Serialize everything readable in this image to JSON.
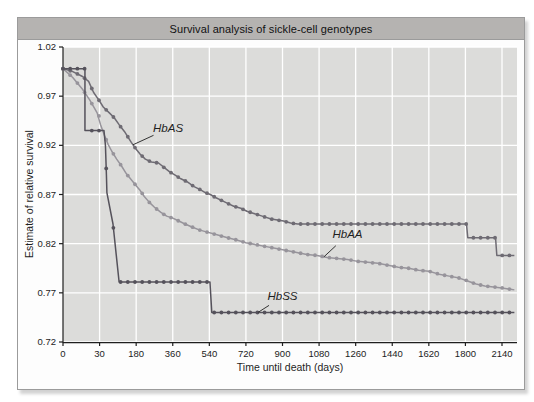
{
  "chart_data": {
    "type": "line",
    "title": "Survival analysis of sickle-cell genotypes",
    "xlabel": "Time until death (days)",
    "ylabel": "Estimate of relative survival",
    "x_ticks": [
      0,
      30,
      180,
      360,
      540,
      720,
      900,
      1080,
      1260,
      1440,
      1620,
      1800,
      2140
    ],
    "x_scale_note": "ticks are evenly spaced on screen although day values are non-linear",
    "y_ticks": [
      1.02,
      0.97,
      0.92,
      0.87,
      0.82,
      0.77,
      0.72
    ],
    "ylim": [
      0.72,
      1.02
    ],
    "grid": "white gridlines on light-gray plot background",
    "legend_position": "inline italic labels with pointer lines",
    "marker": "small filled circles along each step curve",
    "series": [
      {
        "name": "HbAA",
        "color": "#97949b",
        "points": [
          [
            0,
            0.998
          ],
          [
            8,
            0.989
          ],
          [
            16,
            0.977
          ],
          [
            22,
            0.966
          ],
          [
            28,
            0.953
          ],
          [
            34,
            0.941
          ],
          [
            50,
            0.93
          ],
          [
            65,
            0.921
          ],
          [
            80,
            0.914
          ],
          [
            100,
            0.906
          ],
          [
            120,
            0.899
          ],
          [
            140,
            0.891
          ],
          [
            160,
            0.885
          ],
          [
            180,
            0.879
          ],
          [
            200,
            0.874
          ],
          [
            220,
            0.868
          ],
          [
            245,
            0.862
          ],
          [
            270,
            0.857
          ],
          [
            300,
            0.852
          ],
          [
            330,
            0.848
          ],
          [
            360,
            0.846
          ],
          [
            390,
            0.843
          ],
          [
            420,
            0.84
          ],
          [
            455,
            0.837
          ],
          [
            490,
            0.834
          ],
          [
            525,
            0.832
          ],
          [
            560,
            0.83
          ],
          [
            595,
            0.828
          ],
          [
            630,
            0.826
          ],
          [
            670,
            0.824
          ],
          [
            720,
            0.821
          ],
          [
            770,
            0.819
          ],
          [
            820,
            0.817
          ],
          [
            870,
            0.815
          ],
          [
            920,
            0.813
          ],
          [
            970,
            0.811
          ],
          [
            1020,
            0.809
          ],
          [
            1070,
            0.808
          ],
          [
            1120,
            0.806
          ],
          [
            1170,
            0.805
          ],
          [
            1220,
            0.804
          ],
          [
            1270,
            0.802
          ],
          [
            1320,
            0.801
          ],
          [
            1370,
            0.8
          ],
          [
            1420,
            0.798
          ],
          [
            1470,
            0.796
          ],
          [
            1520,
            0.795
          ],
          [
            1570,
            0.793
          ],
          [
            1620,
            0.792
          ],
          [
            1670,
            0.789
          ],
          [
            1720,
            0.787
          ],
          [
            1770,
            0.785
          ],
          [
            1820,
            0.782
          ],
          [
            1900,
            0.779
          ],
          [
            1980,
            0.777
          ],
          [
            2060,
            0.776
          ],
          [
            2140,
            0.775
          ],
          [
            2255,
            0.773
          ]
        ]
      },
      {
        "name": "HbAS",
        "color": "#6e6b73",
        "points": [
          [
            0,
            0.998
          ],
          [
            8,
            0.995
          ],
          [
            16,
            0.99
          ],
          [
            21,
            0.985
          ],
          [
            25,
            0.974
          ],
          [
            30,
            0.965
          ],
          [
            45,
            0.959
          ],
          [
            70,
            0.953
          ],
          [
            90,
            0.948
          ],
          [
            110,
            0.941
          ],
          [
            135,
            0.933
          ],
          [
            160,
            0.923
          ],
          [
            180,
            0.916
          ],
          [
            200,
            0.911
          ],
          [
            225,
            0.906
          ],
          [
            255,
            0.903
          ],
          [
            290,
            0.902
          ],
          [
            320,
            0.897
          ],
          [
            345,
            0.893
          ],
          [
            370,
            0.89
          ],
          [
            400,
            0.886
          ],
          [
            430,
            0.883
          ],
          [
            465,
            0.878
          ],
          [
            495,
            0.875
          ],
          [
            520,
            0.872
          ],
          [
            545,
            0.87
          ],
          [
            570,
            0.867
          ],
          [
            600,
            0.864
          ],
          [
            630,
            0.861
          ],
          [
            660,
            0.858
          ],
          [
            695,
            0.856
          ],
          [
            725,
            0.853
          ],
          [
            755,
            0.851
          ],
          [
            785,
            0.849
          ],
          [
            815,
            0.847
          ],
          [
            845,
            0.845
          ],
          [
            875,
            0.844
          ],
          [
            905,
            0.843
          ],
          [
            940,
            0.841
          ],
          [
            975,
            0.84
          ],
          [
            1810,
            0.84
          ],
          [
            1822,
            0.826
          ],
          [
            2080,
            0.826
          ],
          [
            2092,
            0.808
          ],
          [
            2255,
            0.808
          ]
        ]
      },
      {
        "name": "HbSS",
        "color": "#55525b",
        "points": [
          [
            0,
            0.998
          ],
          [
            18,
            0.998
          ],
          [
            18,
            0.935
          ],
          [
            48,
            0.935
          ],
          [
            54,
            0.92
          ],
          [
            58,
            0.89
          ],
          [
            60,
            0.872
          ],
          [
            85,
            0.84
          ],
          [
            110,
            0.781
          ],
          [
            543,
            0.781
          ],
          [
            552,
            0.75
          ],
          [
            2255,
            0.75
          ]
        ]
      }
    ],
    "annotations": [
      {
        "series": "HbAS",
        "text": "HbAS",
        "label_day": 337,
        "label_value": 0.937,
        "point_day": 167
      },
      {
        "series": "HbAA",
        "text": "HbAA",
        "label_day": 1220,
        "label_value": 0.829,
        "point_day": 1104
      },
      {
        "series": "HbSS",
        "text": "HbSS",
        "label_day": 900,
        "label_value": 0.766,
        "point_day": 779
      }
    ]
  },
  "colors": {
    "title_bar_bg": "#b5b3b1",
    "figure_border": "#9b9b9b",
    "plot_bg": "#dcdcda",
    "gridline": "#ffffff",
    "axis": "#1f1f1f",
    "tick_label": "#1c1c1c",
    "annotation_text": "#1f1f1f"
  }
}
